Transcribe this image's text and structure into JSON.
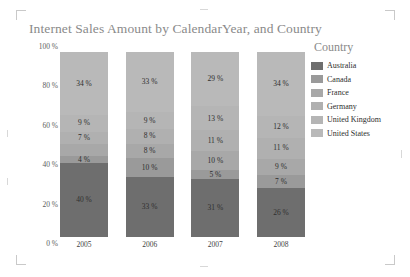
{
  "chart_data": {
    "type": "bar",
    "title": "Internet Sales Amount by CalendarYear, and Country",
    "xlabel": "",
    "ylabel": "",
    "ylim": [
      0,
      100
    ],
    "grid": false,
    "stacked": true,
    "stack_mode": "percent",
    "legend_position": "right",
    "legend_title": "Country",
    "categories": [
      "2005",
      "2006",
      "2007",
      "2008"
    ],
    "ytick_labels": [
      "0 %",
      "20 %",
      "40 %",
      "60 %",
      "80 %",
      "100 %"
    ],
    "ytick_values": [
      0,
      20,
      40,
      60,
      80,
      100
    ],
    "series": [
      {
        "name": "Australia",
        "color": "#6e6e6e",
        "values": [
          40,
          33,
          31,
          26
        ],
        "labels": [
          "40 %",
          "33 %",
          "31 %",
          "26 %"
        ]
      },
      {
        "name": "Canada",
        "color": "#9a9a9a",
        "values": [
          4,
          10,
          5,
          7
        ],
        "labels": [
          "4 %",
          "10 %",
          "5 %",
          "7 %"
        ]
      },
      {
        "name": "France",
        "color": "#a8a8a8",
        "values": [
          6,
          8,
          10,
          9
        ],
        "labels": [
          "",
          "8 %",
          "10 %",
          "9 %"
        ]
      },
      {
        "name": "Germany",
        "color": "#b0b0b0",
        "values": [
          7,
          8,
          11,
          11
        ],
        "labels": [
          "7 %",
          "8 %",
          "11 %",
          "11 %"
        ]
      },
      {
        "name": "United Kingdom",
        "color": "#b5b5b5",
        "values": [
          9,
          9,
          13,
          12
        ],
        "labels": [
          "9 %",
          "9 %",
          "13 %",
          "12 %"
        ]
      },
      {
        "name": "United States",
        "color": "#b9b9b9",
        "values": [
          34,
          33,
          29,
          34
        ],
        "labels": [
          "34 %",
          "33 %",
          "29 %",
          "34 %"
        ]
      }
    ]
  }
}
